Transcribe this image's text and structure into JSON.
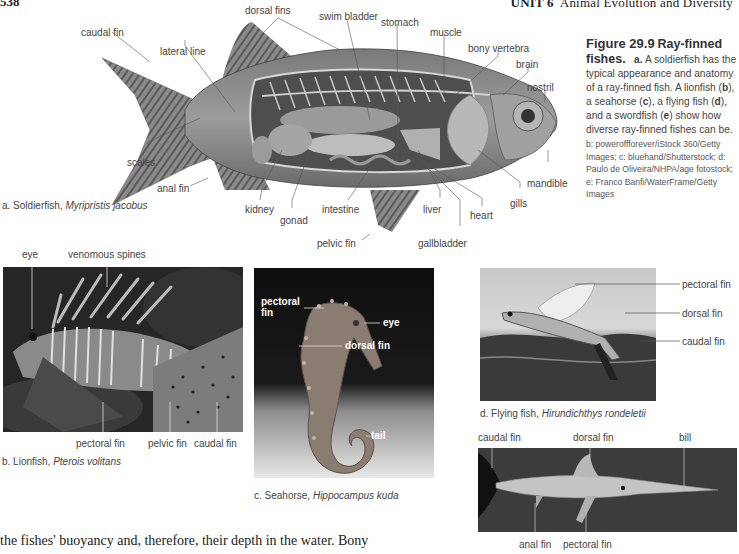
{
  "page": {
    "page_number": "538",
    "running_head_unit": "UNIT 6",
    "running_head_title": "Animal Evolution and Diversity"
  },
  "figure": {
    "number": "Figure 29.9",
    "title": "Ray-finned fishes.",
    "caption_a_letter": "a.",
    "caption_text_1": " A soldierfish has the typical appearance and anatomy of a ray-finned fish. A lionfish (",
    "b": "b",
    "caption_text_2": "), a seahorse (",
    "c": "c",
    "caption_text_3": "), a flying fish (",
    "d": "d",
    "caption_text_4": "), and a swordfish (",
    "e": "e",
    "caption_text_5": ") show how diverse ray-finned fishes can be.",
    "credits": "b: poweroffforever/iStock 360/Getty Images; c: bluehand/Shutterstock; d: Paulo de Oliveira/NHPA/age fotostock; e: Franco Banfi/WaterFrame/Getty Images"
  },
  "panel_a": {
    "caption_prefix": "a. Soldierfish, ",
    "caption_species": "Myripristis jacobus",
    "labels": {
      "caudal_fin": "caudal fin",
      "dorsal_fins": "dorsal fins",
      "lateral_line": "lateral line",
      "swim_bladder": "swim bladder",
      "stomach": "stomach",
      "muscle": "muscle",
      "bony_vertebra": "bony vertebra",
      "brain": "brain",
      "nostril": "nostril",
      "scales": "scales",
      "mandible": "mandible",
      "anal_fin": "anal fin",
      "kidney": "kidney",
      "gonad": "gonad",
      "intestine": "intestine",
      "liver": "liver",
      "gills": "gills",
      "heart": "heart",
      "gallbladder": "gallbladder",
      "pelvic_fin": "pelvic fin"
    }
  },
  "panel_b": {
    "caption_prefix": "b. Lionfish, ",
    "caption_species": "Pterois volitans",
    "labels": {
      "eye": "eye",
      "venomous_spines": "venomous spines",
      "pectoral_fin": "pectoral fin",
      "pelvic_fin": "pelvic fin",
      "caudal_fin": "caudal fin"
    }
  },
  "panel_c": {
    "caption_prefix": "c. Seahorse, ",
    "caption_species": "Hippocampus kuda",
    "labels": {
      "pectoral_fin_1": "pectoral",
      "pectoral_fin_2": "fin",
      "eye": "eye",
      "dorsal_fin": "dorsal fin",
      "tail": "tail"
    }
  },
  "panel_d": {
    "caption_prefix": "d. Flying fish, ",
    "caption_species": "Hirundichthys rondeletii",
    "labels": {
      "pectoral_fin": "pectoral fin",
      "dorsal_fin": "dorsal fin",
      "caudal_fin": "caudal fin"
    }
  },
  "panel_e": {
    "labels": {
      "caudal_fin": "caudal fin",
      "dorsal_fin": "dorsal fin",
      "bill": "bill",
      "anal_fin": "anal fin",
      "pectoral_fin": "pectoral fin"
    }
  },
  "body_text": "the fishes' buoyancy and, therefore, their depth in the water. Bony"
}
